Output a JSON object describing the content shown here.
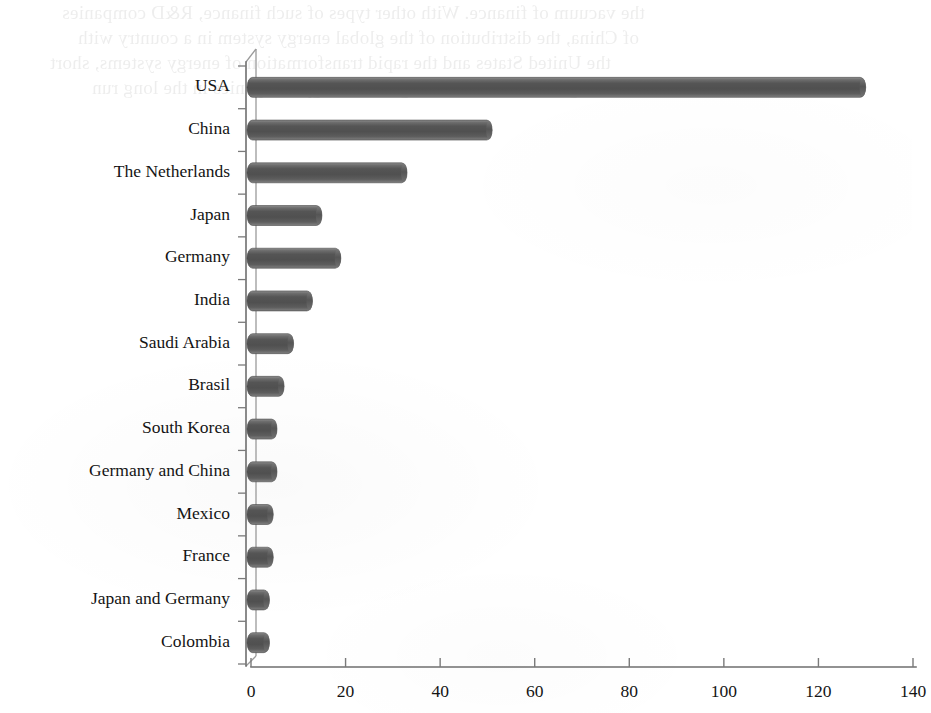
{
  "chart_data": {
    "type": "bar",
    "orientation": "horizontal",
    "title": "",
    "subtitle": "",
    "xlabel": "",
    "ylabel": "",
    "xlim": [
      0,
      140
    ],
    "xticks": [
      "0",
      "20",
      "40",
      "60",
      "80",
      "100",
      "120",
      "140"
    ],
    "xtick_values": [
      0,
      20,
      40,
      60,
      80,
      100,
      120,
      140
    ],
    "grid": false,
    "legend": null,
    "legend_position": "none",
    "bar_color": "#5a5a5a",
    "bar_style": "3d-cylinder",
    "axis_color": "#6e6e6e",
    "categories": [
      "USA",
      "China",
      "The Netherlands",
      "Japan",
      "Germany",
      "India",
      "Saudi Arabia",
      "Brasil",
      "South Korea",
      "Germany and China",
      "Mexico",
      "France",
      "Japan and Germany",
      "Colombia"
    ],
    "values": [
      130,
      51,
      33,
      15,
      19,
      13,
      9,
      7,
      5.5,
      5.5,
      4.7,
      4.7,
      3.9,
      3.9
    ]
  },
  "scan_artifacts": {
    "note": "faint mirrored bleed-through text from the reverse of the scanned page",
    "lines": [
      "the vacuum of finance. With other types of such finance, R&D companies",
      "of China, the distribution of the global energy system in a country with",
      "the United States and the rapid transformation of energy systems, short",
      "and the governments and the global energy companies in the long run"
    ]
  }
}
